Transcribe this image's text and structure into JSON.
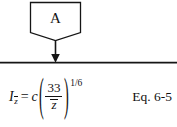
{
  "figure": {
    "background_color": "#ffffff",
    "stroke_color": "#151515",
    "diagram": {
      "node": {
        "shape": "pentagon-down",
        "label": "A"
      },
      "connector": {
        "type": "arrow-down",
        "target": "horizontal-rule"
      },
      "divider": {
        "type": "horizontal-rule"
      }
    }
  },
  "equation": {
    "lhs_symbol": "I",
    "lhs_subscript": "z",
    "equals": "=",
    "coefficient": "c",
    "paren_open": "(",
    "paren_close": ")",
    "fraction_numerator": "33",
    "fraction_denominator": "z",
    "exponent": "1/6",
    "full_text": "I_z̄ = c(33/z̄)^(1/6)",
    "number_label": "Eq. 6-5"
  }
}
